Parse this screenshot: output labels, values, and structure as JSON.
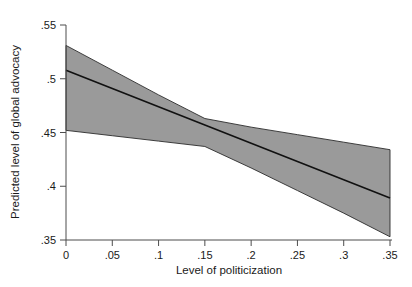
{
  "chart_data": {
    "type": "line",
    "title": "",
    "subtitle": "",
    "xlabel": "Level of politicization",
    "ylabel": "Predicted level of global advocacy",
    "xlim": [
      0,
      0.35
    ],
    "ylim": [
      0.35,
      0.55
    ],
    "grid": false,
    "legend": null,
    "x_ticks": [
      0,
      0.05,
      0.1,
      0.15,
      0.2,
      0.25,
      0.3,
      0.35
    ],
    "x_tick_labels": [
      "0",
      ".05",
      ".1",
      ".15",
      ".2",
      ".25",
      ".3",
      ".35"
    ],
    "y_ticks": [
      0.35,
      0.4,
      0.45,
      0.5,
      0.55
    ],
    "y_tick_labels": [
      ".35",
      ".4",
      ".45",
      ".5",
      ".55"
    ],
    "x": [
      0,
      0.05,
      0.1,
      0.15,
      0.2,
      0.25,
      0.3,
      0.35
    ],
    "series": [
      {
        "name": "Predicted value",
        "kind": "line",
        "color": "#111111",
        "values": [
          0.508,
          0.491,
          0.474,
          0.457,
          0.44,
          0.423,
          0.406,
          0.389
        ]
      },
      {
        "name": "95% confidence interval upper",
        "kind": "band-edge",
        "color": "#9a9a9a",
        "values": [
          0.531,
          0.508,
          0.485,
          0.463,
          0.455,
          0.448,
          0.441,
          0.434
        ]
      },
      {
        "name": "95% confidence interval lower",
        "kind": "band-edge",
        "color": "#9a9a9a",
        "values": [
          0.452,
          0.447,
          0.442,
          0.437,
          0.417,
          0.396,
          0.375,
          0.353
        ]
      }
    ],
    "band_fill_color": "#9a9a9a",
    "axis_color": "#4d4d4d",
    "background_color": "#ffffff"
  },
  "axes": {
    "x_label": "Level of politicization",
    "y_label": "Predicted level of global advocacy"
  },
  "ticks": {
    "x": [
      "0",
      ".05",
      ".1",
      ".15",
      ".2",
      ".25",
      ".3",
      ".35"
    ],
    "y": [
      ".55",
      ".5",
      ".45",
      ".4",
      ".35"
    ]
  }
}
